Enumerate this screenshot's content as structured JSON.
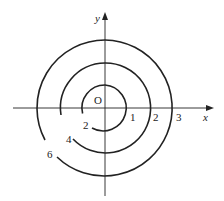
{
  "diagram": {
    "axes": {
      "x_label": "x",
      "y_label": "y",
      "origin_label": "O"
    },
    "x_ticks": [
      "1",
      "2",
      "3"
    ],
    "curves": [
      {
        "level": "2",
        "radius": 1
      },
      {
        "level": "4",
        "radius": 2
      },
      {
        "level": "6",
        "radius": 3
      }
    ],
    "colors": {
      "stroke": "#222222",
      "background": "#ffffff"
    }
  }
}
